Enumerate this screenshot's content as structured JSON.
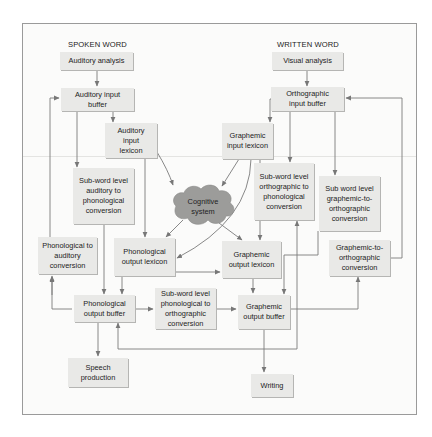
{
  "headings": {
    "spoken_word": "SPOKEN WORD",
    "written_word": "WRITTEN WORD"
  },
  "boxes": {
    "auditory_analysis": "Auditory analysis",
    "auditory_input_buffer": "Auditory input buffer",
    "auditory_input_lexicon": "Auditory input lexicon",
    "subword_auditory_to_phonological": "Sub-word level auditory to phonological conversion",
    "phonological_to_auditory": "Phonological to auditory conversion",
    "phonological_output_lexicon": "Phonological output lexicon",
    "cognitive_system": "Cognitive system",
    "visual_analysis": "Visual analysis",
    "orthographic_input_buffer": "Orthographic input buffer",
    "graphemic_input_lexicon": "Graphemic input lexicon",
    "subword_orthographic_to_phonological": "Sub-word level orthographic to phonological conversion",
    "subword_graphemic_to_orthographic": "Sub word level graphemic-to-orthographic conversion",
    "graphemic_output_lexicon": "Graphemic output lexicon",
    "graphemic_to_orthographic": "Graphemic-to-orthographic conversion",
    "phonological_output_buffer": "Phonological output buffer",
    "subword_phonological_to_orthographic": "Sub-word level phonological to orthographic conversion",
    "graphemic_output_buffer": "Graphemic output buffer",
    "speech_production": "Speech production",
    "writing": "Writing"
  },
  "colors": {
    "box_fill": "#e9e9e7",
    "cloud_fill": "#9c9c9a",
    "arrow": "#777777",
    "frame": "#9a9a9a"
  }
}
